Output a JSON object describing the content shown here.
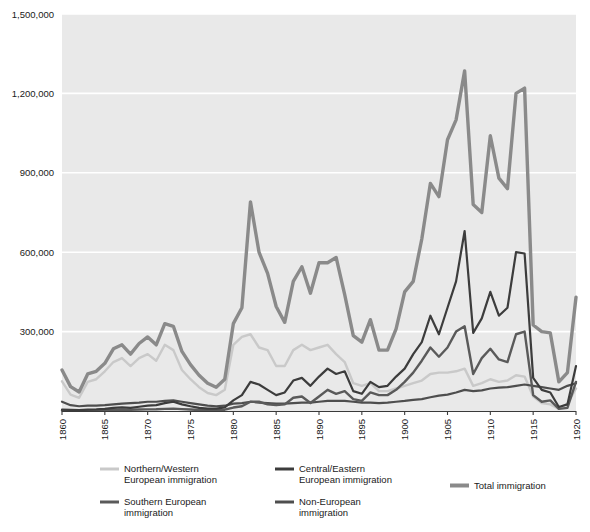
{
  "chart_data": {
    "type": "line",
    "title": "",
    "subtitle": "",
    "xlabel": "",
    "ylabel": "",
    "xlim": [
      1860,
      1920
    ],
    "ylim": [
      0,
      1500000
    ],
    "grid": true,
    "grid_axis": "y",
    "legend_position": "bottom",
    "x_tick_labels": [
      "1860",
      "1865",
      "1870",
      "1875",
      "1880",
      "1885",
      "1890",
      "1895",
      "1900",
      "1905",
      "1910",
      "1915",
      "1920"
    ],
    "x_ticks": [
      1860,
      1865,
      1870,
      1875,
      1880,
      1885,
      1890,
      1895,
      1900,
      1905,
      1910,
      1915,
      1920
    ],
    "y_tick_labels": [
      "300,000",
      "600,000",
      "900,000",
      "1,200,000",
      "1,500,000"
    ],
    "y_ticks": [
      300000,
      600000,
      900000,
      1200000,
      1500000
    ],
    "x": [
      1860,
      1861,
      1862,
      1863,
      1864,
      1865,
      1866,
      1867,
      1868,
      1869,
      1870,
      1871,
      1872,
      1873,
      1874,
      1875,
      1876,
      1877,
      1878,
      1879,
      1880,
      1881,
      1882,
      1883,
      1884,
      1885,
      1886,
      1887,
      1888,
      1889,
      1890,
      1891,
      1892,
      1893,
      1894,
      1895,
      1896,
      1897,
      1898,
      1899,
      1900,
      1901,
      1902,
      1903,
      1904,
      1905,
      1906,
      1907,
      1908,
      1909,
      1910,
      1911,
      1912,
      1913,
      1914,
      1915,
      1916,
      1917,
      1918,
      1919,
      1920
    ],
    "series": [
      {
        "name": "Northern/Western European immigration",
        "color": "#c9c9c9",
        "width": 2.4,
        "values": [
          112000,
          62000,
          50000,
          110000,
          120000,
          150000,
          185000,
          200000,
          170000,
          200000,
          215000,
          190000,
          250000,
          230000,
          155000,
          120000,
          90000,
          68000,
          60000,
          80000,
          250000,
          280000,
          290000,
          240000,
          230000,
          170000,
          170000,
          230000,
          250000,
          230000,
          240000,
          250000,
          215000,
          185000,
          105000,
          95000,
          105000,
          75000,
          75000,
          85000,
          95000,
          105000,
          115000,
          140000,
          145000,
          145000,
          150000,
          160000,
          95000,
          105000,
          120000,
          110000,
          115000,
          135000,
          130000,
          55000,
          30000,
          25000,
          8000,
          28000,
          85000
        ]
      },
      {
        "name": "Southern European immigration",
        "color": "#5a5a5a",
        "width": 2.4,
        "values": [
          2000,
          1500,
          1200,
          2000,
          2500,
          3000,
          4000,
          5000,
          4500,
          5500,
          6000,
          6500,
          8000,
          9000,
          7000,
          5500,
          4000,
          3500,
          3500,
          5000,
          13000,
          18000,
          35000,
          35000,
          25000,
          22000,
          25000,
          50000,
          55000,
          30000,
          55000,
          80000,
          65000,
          75000,
          45000,
          38000,
          70000,
          60000,
          60000,
          80000,
          110000,
          145000,
          190000,
          240000,
          205000,
          240000,
          300000,
          320000,
          140000,
          200000,
          235000,
          195000,
          185000,
          290000,
          300000,
          60000,
          35000,
          40000,
          8000,
          12000,
          110000
        ]
      },
      {
        "name": "Central/Eastern European immigration",
        "color": "#3c3c3c",
        "width": 2.2,
        "values": [
          5000,
          4000,
          3000,
          5000,
          6000,
          8000,
          12000,
          14000,
          12000,
          16000,
          20000,
          22000,
          30000,
          35000,
          25000,
          18000,
          12000,
          9000,
          9000,
          14000,
          40000,
          60000,
          110000,
          100000,
          80000,
          60000,
          70000,
          115000,
          125000,
          95000,
          130000,
          160000,
          140000,
          150000,
          75000,
          65000,
          110000,
          90000,
          95000,
          130000,
          160000,
          215000,
          260000,
          360000,
          290000,
          390000,
          490000,
          680000,
          295000,
          350000,
          450000,
          360000,
          390000,
          600000,
          595000,
          125000,
          80000,
          70000,
          15000,
          25000,
          170000
        ]
      },
      {
        "name": "Non-European immigration",
        "color": "#4e4e4e",
        "width": 2.2,
        "values": [
          35000,
          22000,
          18000,
          20000,
          20000,
          22000,
          25000,
          28000,
          30000,
          32000,
          35000,
          35000,
          38000,
          40000,
          35000,
          30000,
          25000,
          20000,
          18000,
          20000,
          28000,
          30000,
          35000,
          32000,
          30000,
          28000,
          28000,
          30000,
          32000,
          32000,
          35000,
          38000,
          38000,
          38000,
          35000,
          32000,
          32000,
          30000,
          32000,
          35000,
          38000,
          42000,
          45000,
          52000,
          58000,
          62000,
          70000,
          80000,
          75000,
          78000,
          85000,
          88000,
          90000,
          95000,
          100000,
          95000,
          90000,
          85000,
          80000,
          95000,
          105000
        ]
      },
      {
        "name": "Total immigration",
        "color": "#8a8a8a",
        "width": 3.4,
        "values": [
          155000,
          92000,
          72000,
          140000,
          150000,
          180000,
          235000,
          250000,
          215000,
          255000,
          280000,
          250000,
          330000,
          320000,
          225000,
          175000,
          135000,
          105000,
          90000,
          120000,
          330000,
          390000,
          790000,
          600000,
          520000,
          395000,
          335000,
          490000,
          545000,
          445000,
          560000,
          560000,
          580000,
          440000,
          285000,
          260000,
          345000,
          230000,
          230000,
          310000,
          450000,
          490000,
          650000,
          860000,
          810000,
          1025000,
          1100000,
          1285000,
          780000,
          750000,
          1040000,
          880000,
          840000,
          1200000,
          1220000,
          325000,
          300000,
          295000,
          110000,
          145000,
          430000
        ]
      }
    ]
  },
  "legend": {
    "entries": [
      {
        "label_line1": "Northern/Western",
        "label_line2": "European immigration",
        "color": "#c9c9c9"
      },
      {
        "label_line1": "Southern European",
        "label_line2": "immigration",
        "color": "#5a5a5a"
      },
      {
        "label_line1": "Central/Eastern",
        "label_line2": "European immigration",
        "color": "#3c3c3c"
      },
      {
        "label_line1": "Non-European",
        "label_line2": "immigration",
        "color": "#4e4e4e"
      },
      {
        "label_line1": "Total immigration",
        "label_line2": "",
        "color": "#8a8a8a"
      }
    ]
  },
  "colors": {
    "plot_background": "#e9e9e9",
    "gridline": "#ffffff",
    "axis": "#3a3a3a",
    "text": "#1a1a1a",
    "page_background": "#ffffff"
  }
}
